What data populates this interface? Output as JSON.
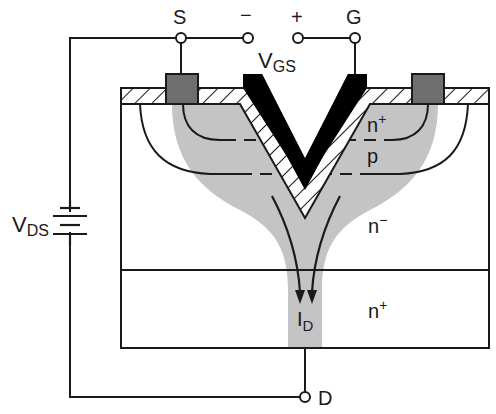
{
  "diagram": {
    "terminals": {
      "source": "S",
      "gate": "G",
      "drain": "D",
      "vgs_minus": "−",
      "vgs_plus": "+"
    },
    "voltages": {
      "vgs_main": "V",
      "vgs_sub": "GS",
      "vds_main": "V",
      "vds_sub": "DS"
    },
    "regions": {
      "source_doping": "n",
      "source_doping_sup": "+",
      "body_doping": "p",
      "drift_doping": "n",
      "drift_doping_sup": "−",
      "substrate_doping": "n",
      "substrate_doping_sup": "+"
    },
    "current": {
      "main": "I",
      "sub": "D"
    },
    "colors": {
      "line": "#1a1a1a",
      "metal_contact": "#6e6e6e",
      "current_path": "#c4c4c4",
      "gate_metal": "#000000",
      "oxide_hatch": "#1a1a1a"
    }
  }
}
